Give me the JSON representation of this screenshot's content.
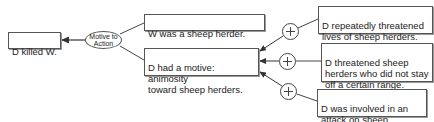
{
  "diagram": {
    "type": "argument-map",
    "conclusion": {
      "id": "n1",
      "label": "D killed W."
    },
    "inference": {
      "id": "e1",
      "label": "Motive to\nAction",
      "sign": "+"
    },
    "premises": [
      {
        "id": "n2",
        "label": "W was a sheep herder."
      },
      {
        "id": "n3",
        "label": "D had a motive: animosity\ntoward sheep herders."
      }
    ],
    "supports": [
      {
        "id": "n4",
        "label": "D repeatedly threatened\nlives of sheep herders.",
        "sign": "+",
        "target": "n3"
      },
      {
        "id": "n5",
        "label": "D threatened sheep\nherders who did not stay\noff a certain range.",
        "sign": "+",
        "target": "n3"
      },
      {
        "id": "n6",
        "label": "D was involved in an\nattack on sheep herders.",
        "sign": "+",
        "target": "n3"
      }
    ],
    "edges": [
      {
        "from": "e1",
        "to": "n1",
        "arrow": true
      },
      {
        "from": "n2",
        "to": "e1",
        "arrow": false
      },
      {
        "from": "n3",
        "to": "e1",
        "arrow": false
      },
      {
        "from": "n4",
        "to": "n3",
        "arrow": true,
        "via": "plus"
      },
      {
        "from": "n5",
        "to": "n3",
        "arrow": true,
        "via": "plus"
      },
      {
        "from": "n6",
        "to": "n3",
        "arrow": true,
        "via": "plus"
      }
    ],
    "colors": {
      "line": "#444444",
      "border": "#555555",
      "background": "#ffffff"
    }
  }
}
